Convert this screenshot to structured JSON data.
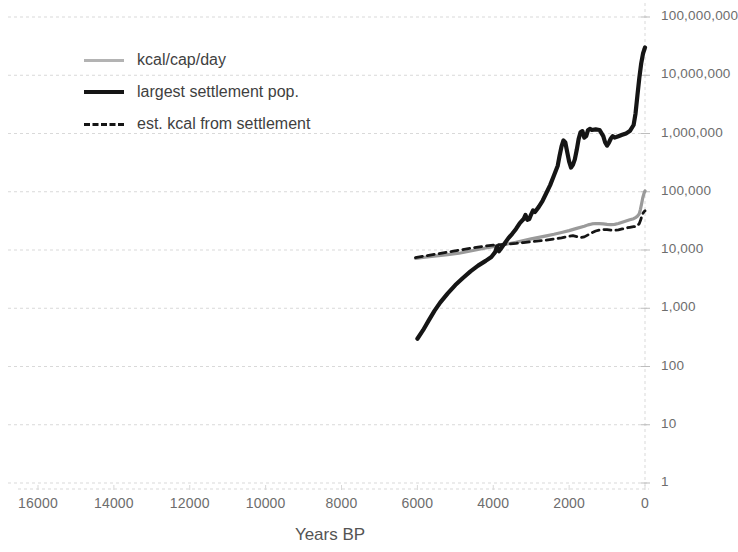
{
  "chart_data": {
    "type": "line",
    "title": "",
    "subtitle": "",
    "xlabel": "Years BP",
    "ylabel": "",
    "x_axis": {
      "reversed": true,
      "min": 0,
      "max": 16000,
      "ticks": [
        16000,
        14000,
        12000,
        10000,
        8000,
        6000,
        4000,
        2000,
        0
      ],
      "tick_labels": [
        "16000",
        "14000",
        "12000",
        "10000",
        "8000",
        "6000",
        "4000",
        "2000",
        "0"
      ]
    },
    "y_axis": {
      "scale": "log10",
      "min": 1,
      "max": 100000000,
      "ticks": [
        100000000,
        10000000,
        1000000,
        100000,
        10000,
        1000,
        100,
        10,
        1
      ],
      "tick_labels": [
        "100,000,000",
        "10,000,000",
        "1,000,000",
        "100,000",
        "10,000",
        "1,000",
        "100",
        "10",
        "1"
      ]
    },
    "grid": true,
    "grid_style": "dotted",
    "legend_position": "upper-left",
    "series": [
      {
        "name": "kcal/cap/day",
        "color": "#9a9a9a",
        "style": "solid",
        "width": 3.2,
        "points": [
          [
            6050,
            7200
          ],
          [
            5800,
            7500
          ],
          [
            5500,
            7900
          ],
          [
            5200,
            8300
          ],
          [
            4900,
            8800
          ],
          [
            4600,
            9600
          ],
          [
            4400,
            10200
          ],
          [
            4200,
            10800
          ],
          [
            4000,
            11400
          ],
          [
            3800,
            12000
          ],
          [
            3600,
            12800
          ],
          [
            3400,
            13600
          ],
          [
            3200,
            14500
          ],
          [
            3000,
            15500
          ],
          [
            2800,
            16500
          ],
          [
            2600,
            17500
          ],
          [
            2400,
            18600
          ],
          [
            2200,
            20000
          ],
          [
            2000,
            21500
          ],
          [
            1800,
            23500
          ],
          [
            1600,
            25500
          ],
          [
            1500,
            27000
          ],
          [
            1400,
            28000
          ],
          [
            1300,
            28500
          ],
          [
            1200,
            28300
          ],
          [
            1100,
            28000
          ],
          [
            1000,
            27500
          ],
          [
            900,
            27200
          ],
          [
            800,
            27500
          ],
          [
            700,
            28500
          ],
          [
            600,
            30000
          ],
          [
            500,
            31500
          ],
          [
            400,
            33000
          ],
          [
            300,
            34500
          ],
          [
            250,
            36000
          ],
          [
            200,
            38000
          ],
          [
            150,
            42000
          ],
          [
            120,
            50000
          ],
          [
            90,
            62000
          ],
          [
            60,
            78000
          ],
          [
            30,
            92000
          ],
          [
            10,
            100000
          ],
          [
            0,
            103000
          ]
        ]
      },
      {
        "name": "largest settlement pop.",
        "color": "#151515",
        "style": "solid",
        "width": 4.2,
        "points": [
          [
            6000,
            300
          ],
          [
            5850,
            420
          ],
          [
            5700,
            620
          ],
          [
            5550,
            900
          ],
          [
            5400,
            1250
          ],
          [
            5200,
            1800
          ],
          [
            5000,
            2500
          ],
          [
            4800,
            3300
          ],
          [
            4600,
            4300
          ],
          [
            4400,
            5400
          ],
          [
            4200,
            6500
          ],
          [
            4050,
            7600
          ],
          [
            3950,
            9200
          ],
          [
            3900,
            11500
          ],
          [
            3850,
            9500
          ],
          [
            3800,
            10500
          ],
          [
            3700,
            13000
          ],
          [
            3600,
            16000
          ],
          [
            3500,
            19000
          ],
          [
            3400,
            23000
          ],
          [
            3300,
            29000
          ],
          [
            3200,
            34000
          ],
          [
            3150,
            40000
          ],
          [
            3100,
            33000
          ],
          [
            3050,
            34000
          ],
          [
            3000,
            41000
          ],
          [
            2950,
            48000
          ],
          [
            2900,
            45000
          ],
          [
            2800,
            55000
          ],
          [
            2700,
            70000
          ],
          [
            2600,
            95000
          ],
          [
            2500,
            130000
          ],
          [
            2400,
            190000
          ],
          [
            2300,
            280000
          ],
          [
            2250,
            420000
          ],
          [
            2200,
            600000
          ],
          [
            2150,
            760000
          ],
          [
            2100,
            700000
          ],
          [
            2050,
            480000
          ],
          [
            2000,
            330000
          ],
          [
            1950,
            260000
          ],
          [
            1900,
            290000
          ],
          [
            1850,
            360000
          ],
          [
            1800,
            520000
          ],
          [
            1750,
            800000
          ],
          [
            1700,
            1050000
          ],
          [
            1650,
            1100000
          ],
          [
            1600,
            850000
          ],
          [
            1550,
            900000
          ],
          [
            1500,
            1150000
          ],
          [
            1450,
            1200000
          ],
          [
            1400,
            1150000
          ],
          [
            1300,
            1180000
          ],
          [
            1200,
            1150000
          ],
          [
            1100,
            900000
          ],
          [
            1050,
            700000
          ],
          [
            1000,
            620000
          ],
          [
            950,
            700000
          ],
          [
            900,
            820000
          ],
          [
            850,
            900000
          ],
          [
            800,
            850000
          ],
          [
            700,
            900000
          ],
          [
            600,
            950000
          ],
          [
            500,
            1000000
          ],
          [
            400,
            1100000
          ],
          [
            300,
            1400000
          ],
          [
            250,
            2200000
          ],
          [
            200,
            4500000
          ],
          [
            150,
            9000000
          ],
          [
            100,
            16000000
          ],
          [
            50,
            24000000
          ],
          [
            10,
            28500000
          ],
          [
            0,
            30000000
          ]
        ]
      },
      {
        "name": "est. kcal from settlement",
        "color": "#151515",
        "style": "dashed",
        "width": 2.8,
        "points": [
          [
            6050,
            7400
          ],
          [
            5800,
            7900
          ],
          [
            5500,
            8500
          ],
          [
            5200,
            9200
          ],
          [
            4900,
            9900
          ],
          [
            4600,
            10700
          ],
          [
            4400,
            11200
          ],
          [
            4200,
            11700
          ],
          [
            4000,
            12100
          ],
          [
            3800,
            12400
          ],
          [
            3600,
            12700
          ],
          [
            3400,
            13000
          ],
          [
            3200,
            13400
          ],
          [
            3000,
            13900
          ],
          [
            2800,
            14400
          ],
          [
            2600,
            14800
          ],
          [
            2400,
            15400
          ],
          [
            2200,
            16200
          ],
          [
            2000,
            17200
          ],
          [
            1900,
            17600
          ],
          [
            1800,
            17000
          ],
          [
            1700,
            16300
          ],
          [
            1600,
            16800
          ],
          [
            1500,
            18200
          ],
          [
            1400,
            19800
          ],
          [
            1300,
            21200
          ],
          [
            1200,
            22000
          ],
          [
            1100,
            22500
          ],
          [
            1000,
            22300
          ],
          [
            900,
            22000
          ],
          [
            800,
            21800
          ],
          [
            700,
            22200
          ],
          [
            600,
            23000
          ],
          [
            500,
            23800
          ],
          [
            400,
            24500
          ],
          [
            300,
            25200
          ],
          [
            250,
            25000
          ],
          [
            200,
            26000
          ],
          [
            150,
            28500
          ],
          [
            120,
            32000
          ],
          [
            90,
            37000
          ],
          [
            60,
            42000
          ],
          [
            30,
            45000
          ],
          [
            10,
            46500
          ],
          [
            0,
            47000
          ]
        ]
      }
    ]
  },
  "legend": {
    "items": [
      {
        "label": "kcal/cap/day",
        "swatch": "gray-solid-line"
      },
      {
        "label": "largest settlement pop.",
        "swatch": "black-solid-line"
      },
      {
        "label": "est. kcal from settlement",
        "swatch": "black-dashed-line"
      }
    ]
  },
  "colors": {
    "series_gray": "#9a9a9a",
    "series_black": "#151515",
    "gridline": "#d9d9d9",
    "tick_text": "#6d6d6d",
    "axis_title": "#545454",
    "background": "#ffffff"
  }
}
